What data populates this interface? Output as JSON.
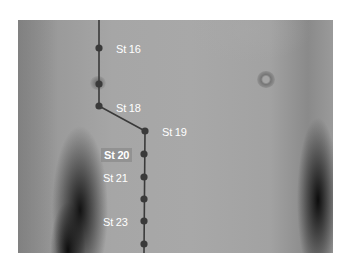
{
  "figure": {
    "line_color": "#3a3a3a",
    "dot_color": "#3a3a3a",
    "label_color": "#ffffff",
    "points": [
      {
        "id": "st16",
        "label": "St 16",
        "x": 99,
        "y": 48,
        "labeled": true
      },
      {
        "id": "st17",
        "label": "",
        "x": 99,
        "y": 84,
        "labeled": false
      },
      {
        "id": "st18",
        "label": "St 18",
        "x": 99,
        "y": 106,
        "labeled": true
      },
      {
        "id": "st19",
        "label": "St 19",
        "x": 145,
        "y": 131,
        "labeled": true
      },
      {
        "id": "st20",
        "label": "St 20",
        "x": 144,
        "y": 154,
        "labeled": true,
        "highlighted": true
      },
      {
        "id": "st21",
        "label": "St 21",
        "x": 144,
        "y": 177,
        "labeled": true
      },
      {
        "id": "st22",
        "label": "",
        "x": 144,
        "y": 199,
        "labeled": false
      },
      {
        "id": "st23",
        "label": "St 23",
        "x": 144,
        "y": 221,
        "labeled": true
      },
      {
        "id": "st24",
        "label": "",
        "x": 144,
        "y": 244,
        "labeled": false
      }
    ],
    "labels": {
      "st16": "St 16",
      "st18": "St 18",
      "st19": "St 19",
      "st20": "St 20",
      "st21": "St 21",
      "st23": "St 23"
    }
  }
}
